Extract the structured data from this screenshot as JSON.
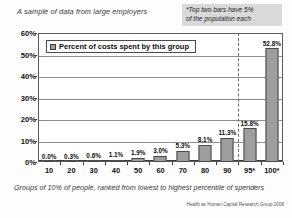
{
  "chart_data": {
    "type": "bar",
    "title": "A sample of data from large employers",
    "xlabel": "Groups of 10% of people, ranked from lowest to highest percentile of spenders",
    "ylabel": "",
    "categories": [
      "10",
      "20",
      "30",
      "40",
      "50",
      "60",
      "70",
      "80",
      "90",
      "95*",
      "100*"
    ],
    "values": [
      0.0,
      0.3,
      0.6,
      1.1,
      1.9,
      3.0,
      5.3,
      8.1,
      11.3,
      15.8,
      52.8
    ],
    "value_labels": [
      "0.0%",
      "0.3%",
      "0.6%",
      "1.1%",
      "1.9%",
      "3.0%",
      "5.3%",
      "8.1%",
      "11.3%",
      "15.8%",
      "52.8%"
    ],
    "ylim": [
      0,
      60
    ],
    "yticks": [
      "0%",
      "10%",
      "20%",
      "30%",
      "40%",
      "50%",
      "60%"
    ],
    "ytick_values": [
      0,
      10,
      20,
      30,
      40,
      50,
      60
    ],
    "grid": "horizontal",
    "legend_position": "top-left",
    "series": [
      {
        "name": "Percent of costs spent by this group",
        "values": [
          0.0,
          0.3,
          0.6,
          1.1,
          1.9,
          3.0,
          5.3,
          8.1,
          11.3,
          15.8,
          52.8
        ],
        "color": "#9e9e9e"
      }
    ],
    "annotations": [
      {
        "name": "top-two-bars-note",
        "text": "*Top two bars have 5% of the population each",
        "position": "top-right"
      },
      {
        "name": "divider",
        "text": "",
        "between_categories": [
          "90",
          "95*"
        ],
        "style": "dashed-vertical"
      }
    ]
  },
  "legend": {
    "label": "Percent of costs spent by this group",
    "swatch_color": "#9e9e9e"
  },
  "annotation": {
    "line1": "*Top two bars have 5%",
    "line2": "of the population each"
  },
  "source": {
    "text": "Health as Human Capital Research Group  2008"
  },
  "colors": {
    "bar_fill": "#9e9e9e",
    "bar_border": "#4a4a4a",
    "gridline": "#8d8d8d",
    "annotation_bg": "#d9d9d9",
    "axis": "#3b3b3b"
  }
}
